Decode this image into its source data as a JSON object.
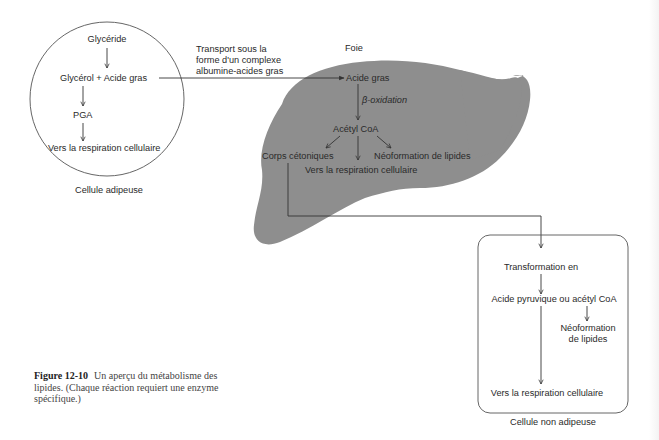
{
  "figure": {
    "number": "Figure 12-10",
    "caption": "Un aperçu du métabolisme des lipides. (Chaque réaction requiert une enzyme spécifique.)"
  },
  "adipose_cell": {
    "label": "Cellule adipeuse",
    "nodes": {
      "glyceride": "Glycéride",
      "glycerol_fatty_acid": "Glycérol + Acide gras",
      "pga": "PGA",
      "respiration": "Vers la respiration cellulaire"
    }
  },
  "transport": {
    "line1": "Transport sous la",
    "line2": "forme d'un complexe",
    "line3": "albumine-acides gras"
  },
  "liver": {
    "label": "Foie",
    "nodes": {
      "fatty_acid": "Acide gras",
      "beta_oxidation": "β-oxidation",
      "acetyl_coa": "Acétyl CoA",
      "ketone_bodies": "Corps cétoniques",
      "respiration": "Vers la respiration cellulaire",
      "lipid_neoformation": "Néoformation de lipides"
    },
    "fill_color": "#8e8e8e"
  },
  "non_adipose_cell": {
    "label": "Cellule non adipeuse",
    "nodes": {
      "transformation": "Transformation en",
      "pyruvic_or_acetyl": "Acide pyruvique ou acétyl CoA",
      "lipid_neoformation_line1": "Néoformation",
      "lipid_neoformation_line2": "de lipides",
      "respiration": "Vers la respiration cellulaire"
    }
  },
  "colors": {
    "line": "#333333",
    "liver_fill": "#8e8e8e",
    "text": "#2a2a2a"
  }
}
